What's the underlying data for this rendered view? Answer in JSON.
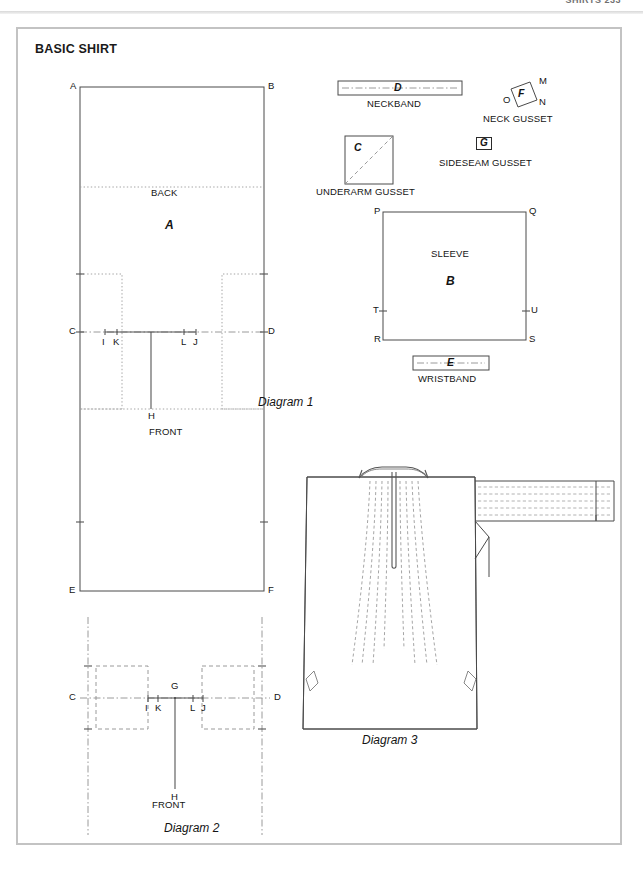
{
  "page": {
    "running_head": "SHIRTS 233",
    "plate_title": "BASIC SHIRT"
  },
  "diagram1": {
    "caption": "Diagram 1",
    "main_piece": {
      "name": "main-body-rectangle",
      "back_label": "BACK",
      "back_letter": "A",
      "front_label": "FRONT",
      "corner_labels": {
        "top_left": "A",
        "top_right": "B",
        "mid_left": "C",
        "mid_right": "D",
        "bottom_left": "E",
        "bottom_right": "F"
      },
      "neck_points": [
        "I",
        "K",
        "L",
        "J"
      ],
      "center_point": "H"
    },
    "neckband": {
      "letter": "D",
      "caption": "NECKBAND"
    },
    "neck_gusset": {
      "letter": "F",
      "caption": "NECK GUSSET",
      "corner_labels": [
        "M",
        "N",
        "O"
      ]
    },
    "underarm_gusset": {
      "letter": "C",
      "caption": "UNDERARM GUSSET"
    },
    "sideseam_gusset": {
      "letter": "G",
      "caption": "SIDESEAM GUSSET"
    },
    "sleeve": {
      "label": "SLEEVE",
      "letter": "B",
      "corner_labels": {
        "top_left": "P",
        "top_right": "Q",
        "bottom_left": "R",
        "bottom_right": "S",
        "mid_left": "T",
        "mid_right": "U"
      }
    },
    "wristband": {
      "letter": "E",
      "caption": "WRISTBAND"
    }
  },
  "diagram2": {
    "caption": "Diagram 2",
    "front_label": "FRONT",
    "point_labels": [
      "C",
      "D",
      "G",
      "H",
      "I",
      "K",
      "L",
      "J"
    ]
  },
  "diagram3": {
    "caption": "Diagram 3"
  },
  "colors": {
    "frame": "#c3c3c3",
    "ink": "#141414",
    "line": "#4a4a4a",
    "construction": "#8a8a8a",
    "page_background": "#ffffff"
  }
}
